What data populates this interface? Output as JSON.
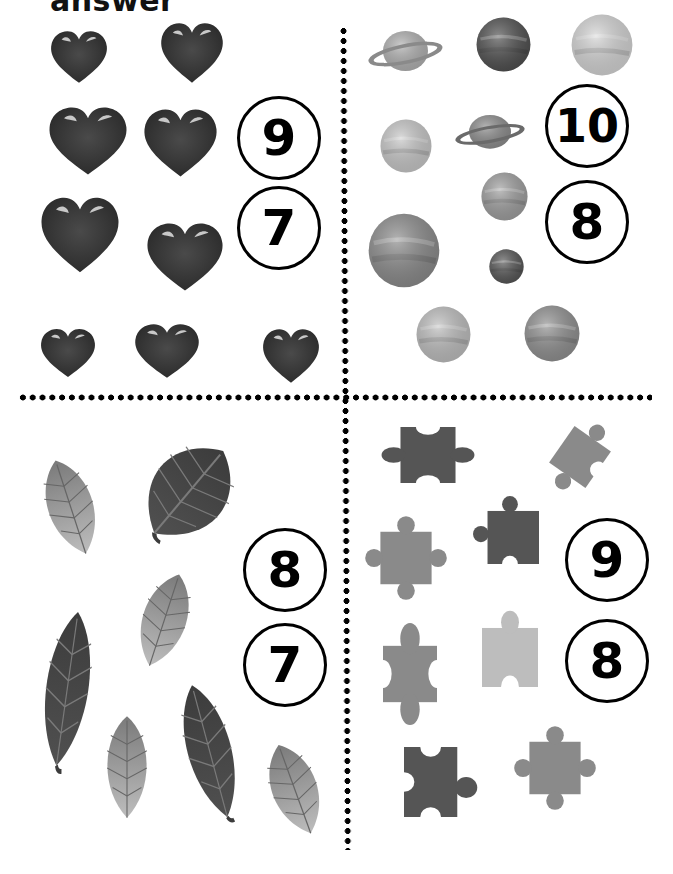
{
  "title": "answer",
  "colors": {
    "heart": "#3a3a3a",
    "heart_highlight": "#c8c8c8",
    "leaf_dark": "#454545",
    "leaf_light": "#9a9a9a",
    "puzzle_dark": "#555555",
    "puzzle_mid": "#8a8a8a",
    "puzzle_light": "#bdbdbd",
    "circle_border": "#000000",
    "dots": "#000000"
  },
  "quadrants": {
    "hearts": {
      "subject": "hearts",
      "count_shown": 8,
      "options": [
        {
          "label": "9",
          "x": 237,
          "y": 96,
          "size": 84,
          "font": 50
        },
        {
          "label": "7",
          "x": 237,
          "y": 186,
          "size": 84,
          "font": 50
        }
      ],
      "items": [
        {
          "x": 50,
          "y": 30,
          "w": 58,
          "h": 54
        },
        {
          "x": 160,
          "y": 22,
          "w": 64,
          "h": 62
        },
        {
          "x": 48,
          "y": 106,
          "w": 80,
          "h": 70
        },
        {
          "x": 143,
          "y": 108,
          "w": 75,
          "h": 70
        },
        {
          "x": 40,
          "y": 196,
          "w": 80,
          "h": 78
        },
        {
          "x": 146,
          "y": 222,
          "w": 78,
          "h": 70
        },
        {
          "x": 40,
          "y": 328,
          "w": 56,
          "h": 50
        },
        {
          "x": 134,
          "y": 323,
          "w": 66,
          "h": 56
        },
        {
          "x": 262,
          "y": 328,
          "w": 58,
          "h": 56
        }
      ]
    },
    "planets": {
      "subject": "planets",
      "options": [
        {
          "label": "10",
          "x": 545,
          "y": 84,
          "size": 84,
          "font": 46
        },
        {
          "label": "8",
          "x": 545,
          "y": 180,
          "size": 84,
          "font": 50
        }
      ],
      "items": [
        {
          "type": "ringed",
          "x": 368,
          "y": 25,
          "w": 75,
          "h": 50,
          "fill": "#b0b0b0",
          "ring": "#8a8a8a"
        },
        {
          "type": "sphere",
          "x": 476,
          "y": 17,
          "w": 55,
          "h": 55,
          "fill": "#4e4e4e"
        },
        {
          "type": "sphere",
          "x": 571,
          "y": 14,
          "w": 62,
          "h": 62,
          "fill": "#d4d4d4"
        },
        {
          "type": "sphere",
          "x": 380,
          "y": 119,
          "w": 52,
          "h": 54,
          "fill": "#c7c7c7"
        },
        {
          "type": "ringed-small",
          "x": 455,
          "y": 110,
          "w": 70,
          "h": 42,
          "fill": "#8c8c8c",
          "ring": "#6a6a6a"
        },
        {
          "type": "sphere",
          "x": 481,
          "y": 172,
          "w": 47,
          "h": 49,
          "fill": "#9e9e9e"
        },
        {
          "type": "sphere",
          "x": 368,
          "y": 213,
          "w": 72,
          "h": 75,
          "fill": "#8a8a8a"
        },
        {
          "type": "sphere",
          "x": 489,
          "y": 249,
          "w": 35,
          "h": 35,
          "fill": "#555555"
        },
        {
          "type": "sphere",
          "x": 416,
          "y": 306,
          "w": 55,
          "h": 57,
          "fill": "#bdbdbd"
        },
        {
          "type": "sphere",
          "x": 524,
          "y": 305,
          "w": 56,
          "h": 57,
          "fill": "#8f8f8f"
        }
      ]
    },
    "leaves": {
      "subject": "leaves",
      "options": [
        {
          "label": "8",
          "x": 243,
          "y": 528,
          "size": 84,
          "font": 50
        },
        {
          "label": "7",
          "x": 243,
          "y": 623,
          "size": 84,
          "font": 50
        }
      ],
      "items": [
        {
          "x": 40,
          "y": 456,
          "w": 62,
          "h": 104,
          "rot": -18,
          "shade": "light"
        },
        {
          "x": 136,
          "y": 436,
          "w": 104,
          "h": 114,
          "rot": 40,
          "shade": "dark"
        },
        {
          "x": 134,
          "y": 570,
          "w": 60,
          "h": 102,
          "rot": 18,
          "shade": "light"
        },
        {
          "x": 38,
          "y": 608,
          "w": 58,
          "h": 165,
          "rot": 8,
          "shade": "dark"
        },
        {
          "x": 100,
          "y": 714,
          "w": 54,
          "h": 108,
          "rot": 0,
          "shade": "light"
        },
        {
          "x": 180,
          "y": 680,
          "w": 60,
          "h": 145,
          "rot": -15,
          "shade": "dark"
        },
        {
          "x": 264,
          "y": 740,
          "w": 62,
          "h": 100,
          "rot": -20,
          "shade": "light"
        }
      ]
    },
    "puzzles": {
      "subject": "puzzle pieces",
      "options": [
        {
          "label": "9",
          "x": 565,
          "y": 518,
          "size": 84,
          "font": 50
        },
        {
          "label": "8",
          "x": 565,
          "y": 619,
          "size": 84,
          "font": 50
        }
      ],
      "items": [
        {
          "x": 385,
          "y": 427,
          "w": 86,
          "h": 56,
          "shade": "dark",
          "variant": "h-tabs"
        },
        {
          "x": 543,
          "y": 420,
          "w": 74,
          "h": 74,
          "shade": "mid",
          "variant": "rotated"
        },
        {
          "x": 366,
          "y": 517,
          "w": 80,
          "h": 82,
          "shade": "mid",
          "variant": "cross"
        },
        {
          "x": 473,
          "y": 496,
          "w": 66,
          "h": 68,
          "shade": "dark",
          "variant": "top-left"
        },
        {
          "x": 383,
          "y": 630,
          "w": 54,
          "h": 88,
          "shade": "mid",
          "variant": "vertical"
        },
        {
          "x": 482,
          "y": 615,
          "w": 56,
          "h": 72,
          "shade": "light",
          "variant": "top-notch"
        },
        {
          "x": 404,
          "y": 747,
          "w": 74,
          "h": 70,
          "shade": "dark",
          "variant": "right-tab"
        },
        {
          "x": 515,
          "y": 727,
          "w": 80,
          "h": 82,
          "shade": "mid",
          "variant": "cross"
        }
      ]
    }
  }
}
